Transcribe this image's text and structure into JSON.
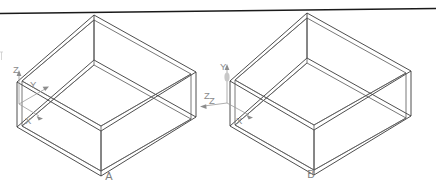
{
  "document": {
    "title": "Isometric rectangular box pair with coordinate axis triads",
    "background_color": "#ffffff",
    "line_color": "#3a3a3a",
    "label_color": "#8a8a8a",
    "rule_color": "#1a1a1a"
  },
  "top_rule": {
    "name": "horizontal-rule",
    "description": "near-horizontal ruled line across the top of the page, slightly sloped downward to the left"
  },
  "figures": [
    {
      "id": "A",
      "caption": "A",
      "shape": "open-top rectangular box drawn in isometric wireframe with doubled (tube) edges",
      "axes": [
        {
          "label": "Z",
          "direction": "up"
        },
        {
          "label": "Y",
          "direction": "right-up (receding depth)"
        },
        {
          "label": "X",
          "direction": "left-down (near edge)"
        }
      ],
      "extra_labels": [
        {
          "label": "Z",
          "position": "right side, near far right vertical edge"
        }
      ]
    },
    {
      "id": "B",
      "caption": "B",
      "shape": "open-top rectangular box drawn in isometric wireframe with doubled (tube) edges",
      "axes": [
        {
          "label": "Y",
          "direction": "up"
        },
        {
          "label": "Z",
          "direction": "left"
        },
        {
          "label": "X",
          "direction": "right-down (near edge)"
        }
      ],
      "extra_labels": []
    }
  ]
}
